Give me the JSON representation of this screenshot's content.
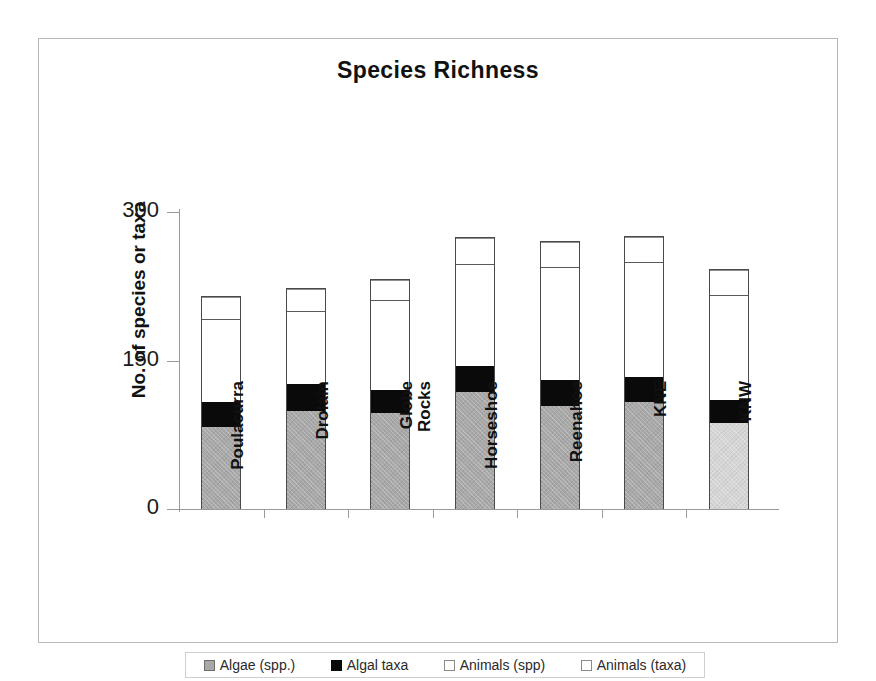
{
  "chart_data": {
    "type": "bar",
    "subtype": "stacked-column",
    "title": "Species Richness",
    "xlabel": "",
    "ylabel": "No. of species or taxa",
    "ylim": [
      0,
      300
    ],
    "yticks": [
      0,
      150,
      300
    ],
    "ytick_labels": [
      "0",
      "150",
      "300"
    ],
    "grid": false,
    "legend_position": "bottom",
    "categories": [
      "Poulacurra",
      "Drolain",
      "Globe Rocks",
      "Horseshoe",
      "Reenahoe",
      "KNE",
      "KNW"
    ],
    "category_label_lines": [
      [
        "Poulacurra"
      ],
      [
        "Drolain"
      ],
      [
        "Globe",
        "Rocks"
      ],
      [
        "Horseshoe"
      ],
      [
        "Reenahoe"
      ],
      [
        "KNE"
      ],
      [
        "KNW"
      ]
    ],
    "series": [
      {
        "name": "Algae (spp.)",
        "color": "#a8a8a8",
        "values": [
          83,
          99,
          97,
          118,
          104,
          108,
          87
        ]
      },
      {
        "name": "Algal taxa",
        "color": "#0a0a0a",
        "values": [
          25,
          27,
          23,
          26,
          26,
          25,
          23
        ]
      },
      {
        "name": "Animals (spp)",
        "color": "#ffffff",
        "values": [
          84,
          74,
          91,
          103,
          114,
          117,
          106
        ]
      },
      {
        "name": "Animals (taxa)",
        "color": "#ffffff",
        "values": [
          22,
          22,
          20,
          27,
          26,
          25,
          25
        ]
      }
    ],
    "totals": [
      194,
      222,
      231,
      274,
      270,
      275,
      241
    ]
  },
  "axis": {
    "y_title": "No. of species or taxa",
    "ticks": [
      "300",
      "150",
      "0"
    ]
  },
  "legend": {
    "items": [
      {
        "label": "Algae (spp.)",
        "swatch": "gray-filled-swatch"
      },
      {
        "label": "Algal taxa",
        "swatch": "black-filled-swatch"
      },
      {
        "label": "Animals (spp)",
        "swatch": "white-outline-swatch"
      },
      {
        "label": "Animals (taxa)",
        "swatch": "white-outline-swatch"
      }
    ]
  },
  "title": "Species Richness"
}
